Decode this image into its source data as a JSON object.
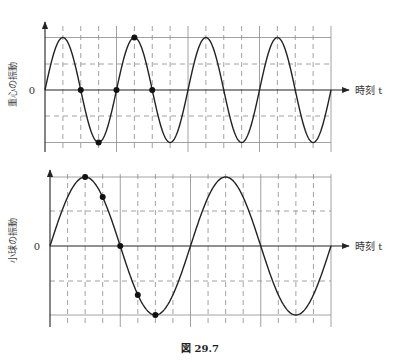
{
  "figure": {
    "caption": "図 29.7"
  },
  "top_chart": {
    "y_label": "重心の振動",
    "x_label": "時刻 t",
    "zero_label": "0",
    "geometry": {
      "x0": 45,
      "x1": 331,
      "y0": 90,
      "amp": 52.5,
      "top_dash": 64,
      "bot_dash": 116,
      "axis_top": 22,
      "axis_bottom": 152,
      "periods": 4,
      "dash_v_count": 16
    },
    "dots": [
      {
        "x": 80.75,
        "y": 90
      },
      {
        "x": 98.6,
        "y": 142.5
      },
      {
        "x": 116.5,
        "y": 90
      },
      {
        "x": 134.4,
        "y": 37.5
      },
      {
        "x": 152.25,
        "y": 90
      }
    ]
  },
  "bottom_chart": {
    "y_label": "小球の振動",
    "x_label": "時刻 t",
    "zero_label": "0",
    "geometry": {
      "x0": 50,
      "x1": 331,
      "y0": 246,
      "amp": 69,
      "top_dash": 211,
      "bot_dash": 281,
      "axis_top": 170,
      "axis_bottom": 327,
      "periods": 2,
      "dash_v_count": 16
    },
    "dots": [
      {
        "x": 85.1,
        "y": 177
      },
      {
        "x": 102.7,
        "y": 197
      },
      {
        "x": 120.25,
        "y": 246
      },
      {
        "x": 137.8,
        "y": 295
      },
      {
        "x": 155.4,
        "y": 315
      }
    ]
  },
  "chart_data": [
    {
      "type": "line",
      "title": "重心の振動",
      "xlabel": "時刻 t",
      "ylabel": "重心の振動",
      "description": "Sine wave, 4 full periods; amplitude 1 (normalized); grid of 16 dashed time divisions",
      "x": [
        0,
        0.25,
        0.5,
        0.75,
        1,
        1.25,
        1.5,
        1.75,
        2,
        2.25,
        2.5,
        2.75,
        3,
        3.25,
        3.5,
        3.75,
        4
      ],
      "values": [
        0,
        1,
        0,
        -1,
        0,
        1,
        0,
        -1,
        0,
        1,
        0,
        -1,
        0,
        1,
        0,
        -1,
        0
      ],
      "marked_points": [
        [
          0.5,
          0
        ],
        [
          0.75,
          -1
        ],
        [
          1.0,
          0
        ],
        [
          1.25,
          1
        ],
        [
          1.5,
          0
        ]
      ],
      "ylim": [
        -1,
        1
      ],
      "grid": true
    },
    {
      "type": "line",
      "title": "小球の振動",
      "xlabel": "時刻 t",
      "ylabel": "小球の振動",
      "description": "Sine wave, 2 full periods (half frequency of top chart); amplitude 1 (normalized)",
      "x": [
        0,
        0.5,
        1,
        1.5,
        2,
        2.5,
        3,
        3.5,
        4
      ],
      "values": [
        0,
        1,
        0,
        -1,
        0,
        1,
        0,
        -1,
        0
      ],
      "marked_points": [
        [
          0.5,
          1
        ],
        [
          0.75,
          0.71
        ],
        [
          1.0,
          0
        ],
        [
          1.25,
          -0.71
        ],
        [
          1.5,
          -1
        ]
      ],
      "ylim": [
        -1,
        1
      ],
      "grid": true
    }
  ]
}
